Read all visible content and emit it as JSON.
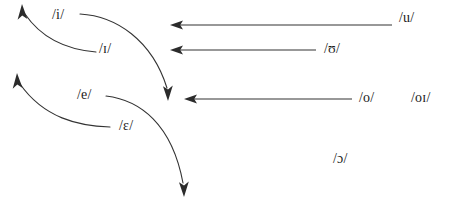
{
  "diagram": {
    "stroke_color": "#333333",
    "text_color": "#1b1b1b",
    "background_color": "#ffffff",
    "labels": {
      "i": "/i/",
      "small_cap_i": "/ɪ/",
      "e": "/e/",
      "epsilon": "/ɛ/",
      "u": "/u/",
      "upsilon": "/ʊ/",
      "o": "/o/",
      "oi": "/oɪ/",
      "open_o": "/ɔ/"
    },
    "arrows": [
      {
        "name": "curve-small-cap-i-to-i-up",
        "kind": "curved",
        "direction": "up-left"
      },
      {
        "name": "curve-i-to-down",
        "kind": "curved",
        "direction": "down-right"
      },
      {
        "name": "curve-epsilon-to-e-up",
        "kind": "curved",
        "direction": "up-left"
      },
      {
        "name": "curve-e-to-down",
        "kind": "curved",
        "direction": "down-right"
      },
      {
        "name": "arrow-u-to-left",
        "kind": "straight",
        "direction": "left"
      },
      {
        "name": "arrow-upsilon-to-left",
        "kind": "straight",
        "direction": "left"
      },
      {
        "name": "arrow-o-to-left",
        "kind": "straight",
        "direction": "left"
      }
    ]
  }
}
